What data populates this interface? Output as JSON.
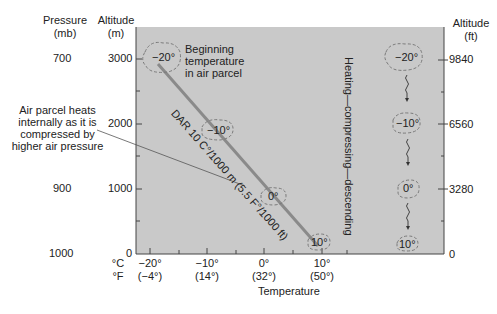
{
  "headers": {
    "pressure": [
      "Pressure",
      "(mb)"
    ],
    "altitude_m": [
      "Altitude",
      "(m)"
    ],
    "altitude_ft": [
      "Altitude",
      "(ft)"
    ]
  },
  "pressure_ticks": [
    "700",
    "900",
    "1000"
  ],
  "altitude_m_ticks": [
    "3000",
    "2000",
    "1000",
    "0"
  ],
  "altitude_ft_ticks": [
    "9840",
    "6560",
    "3280",
    "0"
  ],
  "x_axis": {
    "unit_c": "°C",
    "unit_f": "°F",
    "celsius": [
      "−20°",
      "−10°",
      "0°",
      "10°"
    ],
    "fahrenheit": [
      "(−4°)",
      "(14°)",
      "(32°)",
      "(50°)"
    ],
    "title": "Temperature"
  },
  "annotations": {
    "beginning": [
      "Beginning",
      "temperature",
      "in air parcel"
    ],
    "heats": [
      "Air parcel heats",
      "internally as it is",
      "compressed by",
      "higher air pressure"
    ],
    "dar": "DAR 10 C°/1000 m (5.5 F°/1000 ft)",
    "process": "Heating—compressing—descending"
  },
  "parcels_line": [
    "−20°",
    "−10°",
    "0°",
    "10°"
  ],
  "parcels_column": [
    "−20°",
    "−10°",
    "0°",
    "10°"
  ],
  "colors": {
    "plot_bg": "#c8c8c8",
    "line": "#8a8a8a",
    "parcel_border": "#7a7a7a",
    "axis": "#444444"
  }
}
